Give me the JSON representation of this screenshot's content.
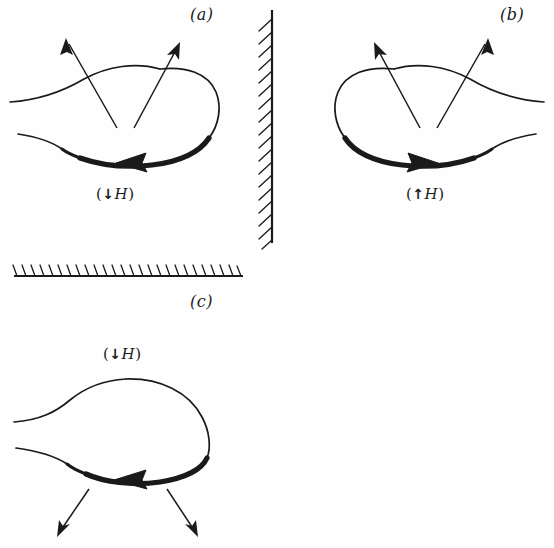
{
  "figure": {
    "width": 554,
    "height": 548,
    "background_color": "#fefefe",
    "ink_color": "#1a1a1a",
    "panels": [
      {
        "id": "a",
        "label": "(a)",
        "field_label": {
          "open_paren": "(",
          "arrow": "↓",
          "arrow_direction": "down",
          "symbol": "H",
          "close_paren": ")",
          "full_text": "(↓H)"
        },
        "ring": {
          "tails_side": "left",
          "bold_arc": "lower-right",
          "circulation_arrowhead": "left",
          "arrow_count": 2,
          "arrow_direction": "up-outward"
        }
      },
      {
        "id": "b",
        "label": "(b)",
        "field_label": {
          "open_paren": "(",
          "arrow": "↑",
          "arrow_direction": "up",
          "symbol": "H",
          "close_paren": ")",
          "full_text": "(↑H)"
        },
        "ring": {
          "tails_side": "right",
          "bold_arc": "lower-left",
          "circulation_arrowhead": "right",
          "arrow_count": 2,
          "arrow_direction": "up-outward"
        }
      },
      {
        "id": "c",
        "label": "(c)",
        "field_label": {
          "open_paren": "(",
          "arrow": "↓",
          "arrow_direction": "down",
          "symbol": "H",
          "close_paren": ")",
          "full_text": "(↓H)"
        },
        "ring": {
          "tails_side": "left",
          "bold_arc": "lower-right",
          "circulation_arrowhead": "left",
          "arrow_count": 2,
          "arrow_direction": "down-outward"
        }
      }
    ],
    "walls": [
      {
        "id": "vertical-wall",
        "orientation": "vertical",
        "hatching_side": "left",
        "hatch_count": 18
      },
      {
        "id": "horizontal-wall",
        "orientation": "horizontal",
        "hatching_side": "below",
        "hatch_count": 24
      }
    ]
  }
}
